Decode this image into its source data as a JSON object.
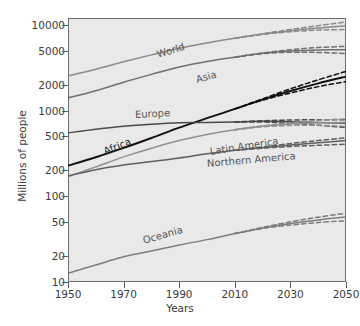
{
  "chart_data": {
    "type": "line",
    "title": "",
    "xlabel": "Years",
    "ylabel": "Millions of people",
    "yscale": "log",
    "xlim": [
      1950,
      2050
    ],
    "ylim": [
      10,
      12000
    ],
    "grid": false,
    "legend_position": "inline-labels",
    "xticks": [
      1950,
      1970,
      1990,
      2010,
      2030,
      2050
    ],
    "xtick_labels": [
      "1950",
      "1970",
      "1990",
      "2010",
      "2030",
      "2050"
    ],
    "yticks": [
      10,
      20,
      50,
      100,
      200,
      500,
      1000,
      2000,
      5000,
      10000
    ],
    "ytick_labels": [
      "10",
      "20",
      "50",
      "100",
      "200",
      "500",
      "1000",
      "2000",
      "5000",
      "10000"
    ],
    "x": [
      1950,
      1960,
      1970,
      1980,
      1990,
      2000,
      2010,
      2020,
      2030,
      2040,
      2050
    ],
    "series": [
      {
        "name": "World",
        "color": "#8a8a8a",
        "label_x": 1982,
        "label_y": 4400,
        "label_rot": -17,
        "values": [
          2536,
          3034,
          3700,
          4458,
          5327,
          6143,
          6957,
          7795,
          8548,
          9198,
          9735
        ],
        "projection_high": [
          null,
          null,
          null,
          null,
          null,
          null,
          6957,
          7860,
          8820,
          9760,
          10800
        ],
        "projection_low": [
          null,
          null,
          null,
          null,
          null,
          null,
          6957,
          7730,
          8300,
          8670,
          8800
        ]
      },
      {
        "name": "Asia",
        "color": "#6f6f6f",
        "label_x": 1996,
        "label_y": 2250,
        "label_rot": -15,
        "values": [
          1404,
          1700,
          2138,
          2642,
          3226,
          3741,
          4194,
          4641,
          4947,
          5098,
          5100
        ],
        "projection_high": [
          null,
          null,
          null,
          null,
          null,
          null,
          4194,
          4690,
          5120,
          5430,
          5600
        ],
        "projection_low": [
          null,
          null,
          null,
          null,
          null,
          null,
          4194,
          4600,
          4780,
          4760,
          4620
        ]
      },
      {
        "name": "Africa",
        "color": "#111111",
        "label_x": 1963,
        "label_y": 330,
        "label_rot": -22,
        "values": [
          228,
          285,
          366,
          478,
          632,
          814,
          1044,
          1341,
          1688,
          2077,
          2489
        ],
        "projection_high": [
          null,
          null,
          null,
          null,
          null,
          null,
          1044,
          1370,
          1790,
          2280,
          2860
        ],
        "projection_low": [
          null,
          null,
          null,
          null,
          null,
          null,
          1044,
          1320,
          1600,
          1900,
          2180
        ]
      },
      {
        "name": "Europe",
        "color": "#4a4a4a",
        "label_x": 1974,
        "label_y": 880,
        "label_rot": -3,
        "values": [
          549,
          605,
          657,
          694,
          721,
          726,
          736,
          748,
          741,
          725,
          710
        ],
        "projection_high": [
          null,
          null,
          null,
          null,
          null,
          null,
          736,
          760,
          775,
          780,
          780
        ],
        "projection_low": [
          null,
          null,
          null,
          null,
          null,
          null,
          736,
          735,
          710,
          672,
          635
        ]
      },
      {
        "name": "Latin America",
        "color": "#909090",
        "label_x": 2001,
        "label_y": 330,
        "label_rot": -9,
        "values": [
          169,
          220,
          288,
          364,
          446,
          526,
          596,
          654,
          695,
          718,
          726
        ],
        "projection_high": [
          null,
          null,
          null,
          null,
          null,
          null,
          596,
          662,
          722,
          768,
          800
        ],
        "projection_low": [
          null,
          null,
          null,
          null,
          null,
          null,
          596,
          646,
          670,
          672,
          655
        ]
      },
      {
        "name": "Northern America",
        "color": "#5f5f5f",
        "label_x": 2000,
        "label_y": 240,
        "label_rot": -5,
        "values": [
          173,
          204,
          231,
          254,
          280,
          313,
          343,
          369,
          396,
          420,
          446
        ],
        "projection_high": [
          null,
          null,
          null,
          null,
          null,
          null,
          343,
          375,
          412,
          447,
          480
        ],
        "projection_low": [
          null,
          null,
          null,
          null,
          null,
          null,
          343,
          363,
          380,
          393,
          404
        ]
      },
      {
        "name": "Oceania",
        "color": "#7d7d7d",
        "label_x": 1977,
        "label_y": 30,
        "label_rot": -16,
        "values": [
          12.6,
          15.8,
          19.7,
          23.0,
          27.0,
          31.2,
          36.7,
          42.7,
          48.1,
          53.0,
          57.4
        ],
        "projection_high": [
          null,
          null,
          null,
          null,
          null,
          null,
          36.7,
          43.4,
          50.3,
          57.0,
          63.5
        ],
        "projection_low": [
          null,
          null,
          null,
          null,
          null,
          null,
          36.7,
          42.1,
          46.2,
          49.4,
          51.8
        ]
      }
    ],
    "notes": {
      "solid_line_meaning": "medium variant / estimates",
      "dashed_line_meaning": "high and low projection variants",
      "projection_start_year": 2010
    }
  },
  "axes": {
    "y_label": "Millions of people",
    "x_label": "Years"
  }
}
